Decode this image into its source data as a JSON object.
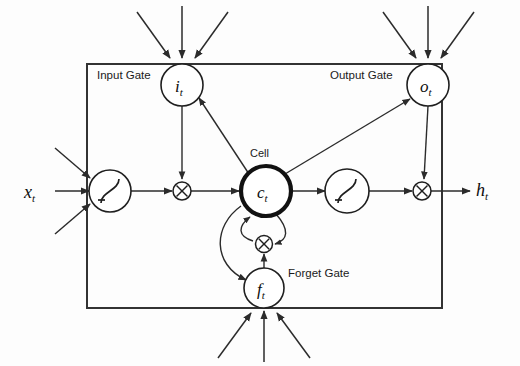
{
  "figure": {
    "type": "lstm-memory-block-diagram",
    "background_color": "#fdfdfd",
    "line_color": "#2b2b2b",
    "border_color": "#333333"
  },
  "labels": {
    "input_gate": "Input Gate",
    "output_gate": "Output Gate",
    "forget_gate": "Forget Gate",
    "cell": "Cell"
  },
  "nodes": {
    "input_gate_symbol": "i",
    "input_gate_subscript": "t",
    "output_gate_symbol": "o",
    "output_gate_subscript": "t",
    "forget_gate_symbol": "f",
    "forget_gate_subscript": "t",
    "cell_symbol": "c",
    "cell_subscript": "t",
    "input_symbol": "x",
    "input_subscript": "t",
    "output_symbol": "h",
    "output_subscript": "t"
  },
  "operators": {
    "multiply_glyph": "×",
    "squash_glyph": "sigmoid-curve"
  }
}
